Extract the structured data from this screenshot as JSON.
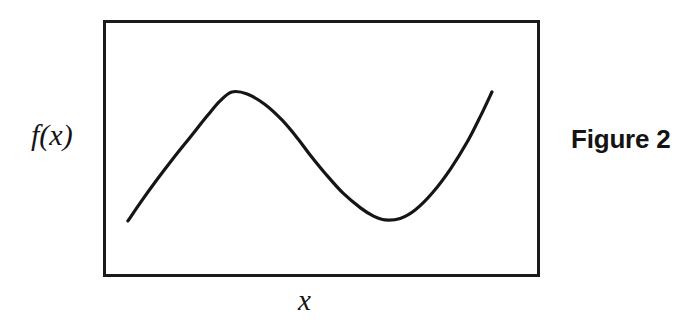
{
  "figure": {
    "caption": "Figure 2",
    "background_color": "#ffffff",
    "ink_color": "#151515"
  },
  "axes": {
    "y_label": "f(x)",
    "x_label": "x",
    "frame": {
      "left": 103,
      "top": 20,
      "width": 437,
      "height": 257,
      "border_width": 3,
      "border_color": "#1a1a1a"
    }
  },
  "chart_data": {
    "type": "line",
    "title": "Figure 2",
    "subtitle": "",
    "xlabel": "x",
    "ylabel": "f(x)",
    "grid": false,
    "legend": false,
    "axis_ticks": false,
    "xlim": [
      0,
      1
    ],
    "ylim": [
      0,
      1
    ],
    "annotations": [],
    "series": [
      {
        "name": "f(x)",
        "color": "#151515",
        "line_width": 3.2,
        "description": "Smooth S-shaped cubic-like curve: rises steeply from lower-left to a rounded local maximum, falls through an inflection to a rounded local minimum, then rises steeply to the upper-right.",
        "features": [
          {
            "name": "start-point",
            "x": 0.057,
            "y": 0.218
          },
          {
            "name": "local-maximum",
            "x": 0.295,
            "y": 0.72
          },
          {
            "name": "inflection-point",
            "x": 0.474,
            "y": 0.475
          },
          {
            "name": "local-minimum",
            "x": 0.645,
            "y": 0.222
          },
          {
            "name": "end-point",
            "x": 0.89,
            "y": 0.72
          }
        ],
        "points": [
          {
            "x": 0.057,
            "y": 0.218
          },
          {
            "x": 0.09,
            "y": 0.3
          },
          {
            "x": 0.125,
            "y": 0.382
          },
          {
            "x": 0.16,
            "y": 0.46
          },
          {
            "x": 0.2,
            "y": 0.545
          },
          {
            "x": 0.24,
            "y": 0.63
          },
          {
            "x": 0.268,
            "y": 0.685
          },
          {
            "x": 0.295,
            "y": 0.72
          },
          {
            "x": 0.33,
            "y": 0.712
          },
          {
            "x": 0.37,
            "y": 0.672
          },
          {
            "x": 0.41,
            "y": 0.61
          },
          {
            "x": 0.445,
            "y": 0.54
          },
          {
            "x": 0.474,
            "y": 0.475
          },
          {
            "x": 0.51,
            "y": 0.4
          },
          {
            "x": 0.55,
            "y": 0.325
          },
          {
            "x": 0.59,
            "y": 0.268
          },
          {
            "x": 0.62,
            "y": 0.236
          },
          {
            "x": 0.645,
            "y": 0.222
          },
          {
            "x": 0.68,
            "y": 0.228
          },
          {
            "x": 0.715,
            "y": 0.262
          },
          {
            "x": 0.755,
            "y": 0.33
          },
          {
            "x": 0.795,
            "y": 0.42
          },
          {
            "x": 0.835,
            "y": 0.53
          },
          {
            "x": 0.865,
            "y": 0.63
          },
          {
            "x": 0.89,
            "y": 0.72
          }
        ]
      }
    ]
  }
}
